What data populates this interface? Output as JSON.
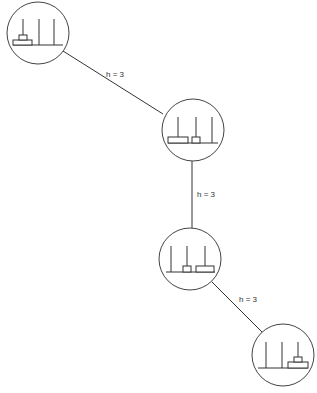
{
  "diagram": {
    "type": "state-search-path",
    "colors": {
      "stroke": "#333333",
      "background": "#ffffff"
    },
    "nodes": [
      {
        "id": "n1",
        "cx": 38,
        "cy": 33,
        "r": 31,
        "state": {
          "peg1": [
            "large",
            "small"
          ],
          "peg2": [],
          "peg3": []
        }
      },
      {
        "id": "n2",
        "cx": 193,
        "cy": 130,
        "r": 31,
        "state": {
          "peg1": [
            "large"
          ],
          "peg2": [
            "small"
          ],
          "peg3": []
        }
      },
      {
        "id": "n3",
        "cx": 190,
        "cy": 259,
        "r": 31,
        "state": {
          "peg1": [],
          "peg2": [
            "small"
          ],
          "peg3": [
            "large"
          ]
        }
      },
      {
        "id": "n4",
        "cx": 283,
        "cy": 355,
        "r": 31,
        "state": {
          "peg1": [],
          "peg2": [],
          "peg3": [
            "large",
            "small"
          ]
        }
      }
    ],
    "edges": [
      {
        "from": "n1",
        "to": "n2",
        "label": "h = 3"
      },
      {
        "from": "n2",
        "to": "n3",
        "label": "h = 3"
      },
      {
        "from": "n3",
        "to": "n4",
        "label": "h = 3"
      }
    ]
  }
}
